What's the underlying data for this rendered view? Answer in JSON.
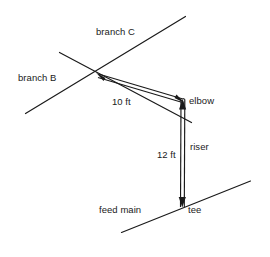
{
  "diagram": {
    "type": "piping-isometric",
    "stroke_color": "#1a1a1a",
    "text_color": "#1a1a1a",
    "background_color": "#ffffff",
    "labels": {
      "branch_c": "branch C",
      "branch_b": "branch B",
      "length_horizontal": "10 ft",
      "elbow": "elbow",
      "riser": "riser",
      "length_vertical": "12 ft",
      "feed_main": "feed main",
      "tee": "tee"
    },
    "dimensions": [
      {
        "name": "horizontal-run",
        "value": 10,
        "unit": "ft",
        "text": "10 ft"
      },
      {
        "name": "riser-height",
        "value": 12,
        "unit": "ft",
        "text": "12 ft"
      }
    ],
    "components": [
      {
        "name": "branch C",
        "kind": "branch-line"
      },
      {
        "name": "branch B",
        "kind": "branch-line"
      },
      {
        "name": "feed main",
        "kind": "main-line"
      },
      {
        "name": "elbow",
        "kind": "fitting"
      },
      {
        "name": "tee",
        "kind": "fitting"
      },
      {
        "name": "riser",
        "kind": "pipe"
      }
    ]
  }
}
